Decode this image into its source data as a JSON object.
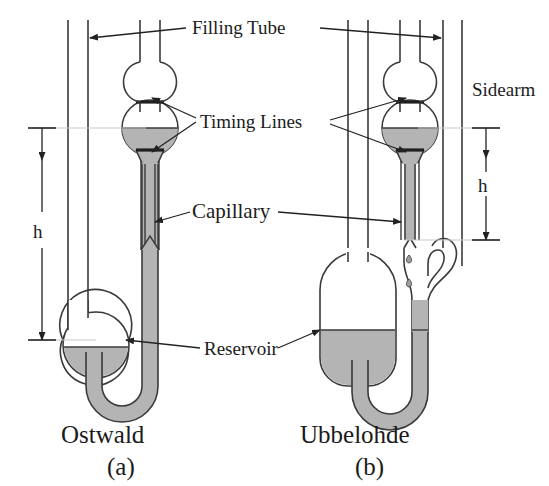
{
  "figure": {
    "background_color": "#ffffff",
    "glass_stroke_color": "#3a3a3a",
    "liquid_color": "#b4b4b4",
    "label_color": "#1b1b1b"
  },
  "labels": {
    "filling_tube": "Filling Tube",
    "timing_lines": "Timing Lines",
    "capillary": "Capillary",
    "reservoir": "Reservoir",
    "sidearm": "Sidearm",
    "height_left": "h",
    "height_right": "h"
  },
  "devices": [
    {
      "name": "Ostwald",
      "caption": "Ostwald",
      "sub_caption": "(a)",
      "has_sidearm": false,
      "features": [
        "filling-tube",
        "upper-bulb",
        "timing-bulb",
        "timing-lines",
        "capillary",
        "reservoir",
        "u-bend"
      ]
    },
    {
      "name": "Ubbelohde",
      "caption": "Ubbelohde",
      "sub_caption": "(b)",
      "has_sidearm": true,
      "features": [
        "filling-tube",
        "upper-bulb",
        "timing-bulb",
        "timing-lines",
        "capillary",
        "suspended-level-drops",
        "reservoir",
        "u-bend",
        "sidearm"
      ]
    }
  ]
}
